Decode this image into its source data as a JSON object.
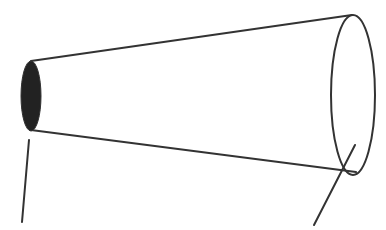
{
  "diagram": {
    "type": "frustum-tube",
    "colors": {
      "stroke": "#333333",
      "small_end_fill": "#222222",
      "background": "#ffffff"
    },
    "small_end": {
      "cx": 31,
      "cy": 96,
      "rx": 10,
      "ry": 35,
      "shaded": true
    },
    "large_end": {
      "cx": 353,
      "cy": 95,
      "rx": 22,
      "ry": 80,
      "shaded": false
    },
    "top_edge": {
      "x1": 31,
      "y1": 61,
      "x2": 352,
      "y2": 15
    },
    "bottom_edge": {
      "x1": 31,
      "y1": 130,
      "x2": 356,
      "y2": 172
    },
    "leader_left": {
      "x1": 29,
      "y1": 140,
      "x2": 22,
      "y2": 222,
      "label": ""
    },
    "leader_right": {
      "x1": 355,
      "y1": 145,
      "x2": 314,
      "y2": 225,
      "label": ""
    }
  }
}
